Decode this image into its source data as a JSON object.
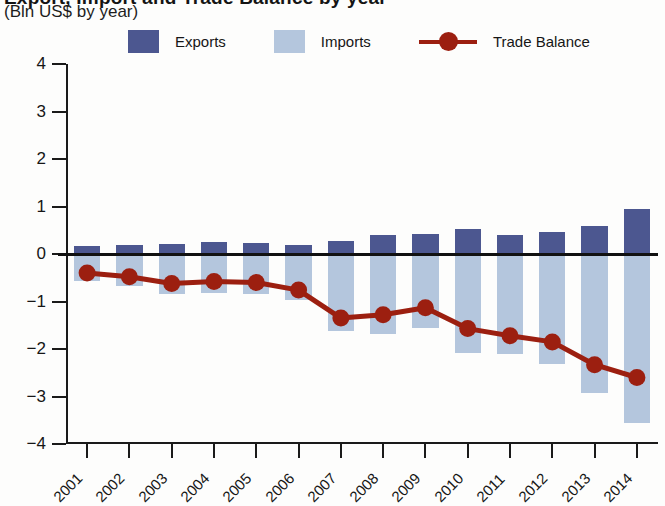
{
  "header": {
    "title_clipped": "Export, Import and Trade Balance by year",
    "subtitle": "(Bln US$ by year)"
  },
  "legend": {
    "items": [
      {
        "label": "Exports",
        "type": "swatch",
        "color": "#4c5790"
      },
      {
        "label": "Imports",
        "type": "swatch",
        "color": "#b4c6dd"
      },
      {
        "label": "Trade Balance",
        "type": "line",
        "color": "#9c1f10"
      }
    ]
  },
  "axes": {
    "y_ticks": [
      "4",
      "3",
      "2",
      "1",
      "0",
      "-1",
      "-2",
      "-3",
      "-4"
    ],
    "x_labels": [
      "2001",
      "2002",
      "2003",
      "2004",
      "2005",
      "2006",
      "2007",
      "2008",
      "2009",
      "2010",
      "2011",
      "2012",
      "2013",
      "2014"
    ]
  },
  "chart_data": {
    "type": "bar",
    "title": "Export, Import and Trade Balance by year",
    "subtitle": "(Bln US$ by year)",
    "xlabel": "",
    "ylabel": "Bln US$",
    "ylim": [
      -4,
      4
    ],
    "ytick_step": 1,
    "grid": false,
    "legend_position": "top",
    "categories": [
      "2001",
      "2002",
      "2003",
      "2004",
      "2005",
      "2006",
      "2007",
      "2008",
      "2009",
      "2010",
      "2011",
      "2012",
      "2013",
      "2014"
    ],
    "series": [
      {
        "name": "Exports",
        "type": "bar",
        "color": "#4c5790",
        "values": [
          0.17,
          0.19,
          0.22,
          0.25,
          0.24,
          0.2,
          0.28,
          0.4,
          0.42,
          0.52,
          0.39,
          0.46,
          0.6,
          0.95
        ]
      },
      {
        "name": "Imports",
        "type": "bar",
        "color": "#b4c6dd",
        "note": "plotted downward as negative values",
        "values": [
          -0.57,
          -0.67,
          -0.84,
          -0.83,
          -0.84,
          -0.96,
          -1.63,
          -1.68,
          -1.55,
          -2.09,
          -2.11,
          -2.31,
          -2.93,
          -3.55
        ]
      },
      {
        "name": "Trade Balance",
        "type": "line",
        "color": "#9c1f10",
        "values": [
          -0.4,
          -0.48,
          -0.62,
          -0.58,
          -0.6,
          -0.76,
          -1.35,
          -1.28,
          -1.13,
          -1.57,
          -1.72,
          -1.85,
          -2.33,
          -2.6
        ]
      }
    ]
  }
}
